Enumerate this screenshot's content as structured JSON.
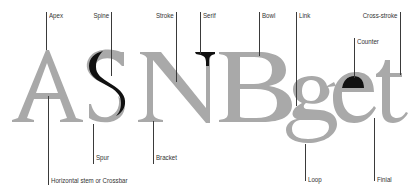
{
  "diagram": {
    "specimen_text": "ASNBget",
    "colors": {
      "letter": "#a9a9a9",
      "highlight": "#111111",
      "leader": "#3a3a3a",
      "label": "#333333",
      "background": "#ffffff"
    },
    "top_labels": [
      {
        "id": "apex",
        "text": "Apex"
      },
      {
        "id": "spine",
        "text": "Spine"
      },
      {
        "id": "stroke",
        "text": "Stroke"
      },
      {
        "id": "serif",
        "text": "Serif"
      },
      {
        "id": "bowl",
        "text": "Bowl"
      },
      {
        "id": "link",
        "text": "Link"
      },
      {
        "id": "cross-stroke",
        "text": "Cross-stroke"
      },
      {
        "id": "counter",
        "text": "Counter"
      }
    ],
    "bottom_labels": [
      {
        "id": "spur",
        "text": "Spur"
      },
      {
        "id": "bracket",
        "text": "Bracket"
      },
      {
        "id": "crossbar",
        "text": "Horizontal stem or Crossbar"
      },
      {
        "id": "loop",
        "text": "Loop"
      },
      {
        "id": "finial",
        "text": "Finial"
      }
    ],
    "highlighted_parts": [
      "S spine",
      "N serif",
      "e counter"
    ]
  }
}
